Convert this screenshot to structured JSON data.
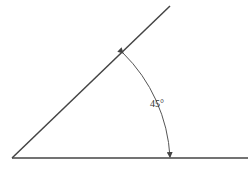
{
  "diagram": {
    "type": "angle",
    "angle_label": "45°",
    "angle_degrees": 45,
    "stroke_color": "#444444",
    "vertex": [
      12,
      158
    ],
    "base_ray_end": [
      248,
      158
    ],
    "inclined_ray_end": [
      170,
      6
    ]
  }
}
